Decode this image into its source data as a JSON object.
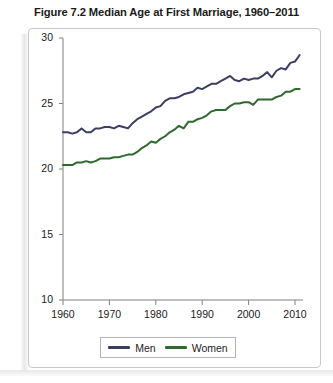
{
  "figure": {
    "title": "Figure 7.2  Median Age at First Marriage, 1960–2011"
  },
  "legend": {
    "entries": [
      {
        "label": "Men",
        "color": "#3a3f63"
      },
      {
        "label": "Women",
        "color": "#2d6b2d"
      }
    ]
  },
  "axes": {
    "y_ticks": [
      "30",
      "25",
      "20",
      "15",
      "10"
    ],
    "x_ticks": [
      "1960",
      "1970",
      "1980",
      "1990",
      "2000",
      "2010"
    ]
  },
  "colors": {
    "men": "#3a3f63",
    "women": "#2d6b2d",
    "axis": "#808080",
    "frame": "#c8c8c8",
    "text": "#1a1a1a",
    "plot_background": "#ffffff"
  },
  "chart_data": {
    "type": "line",
    "title": "Figure 7.2  Median Age at First Marriage, 1960–2011",
    "xlabel": "",
    "ylabel": "",
    "xlim": [
      1960,
      2011
    ],
    "ylim": [
      10,
      30
    ],
    "y_ticks": [
      10,
      15,
      20,
      25,
      30
    ],
    "x_ticks": [
      1960,
      1970,
      1980,
      1990,
      2000,
      2010
    ],
    "grid": false,
    "legend_position": "bottom-center",
    "x": [
      1960,
      1961,
      1962,
      1963,
      1964,
      1965,
      1966,
      1967,
      1968,
      1969,
      1970,
      1971,
      1972,
      1973,
      1974,
      1975,
      1976,
      1977,
      1978,
      1979,
      1980,
      1981,
      1982,
      1983,
      1984,
      1985,
      1986,
      1987,
      1988,
      1989,
      1990,
      1991,
      1992,
      1993,
      1994,
      1995,
      1996,
      1997,
      1998,
      1999,
      2000,
      2001,
      2002,
      2003,
      2004,
      2005,
      2006,
      2007,
      2008,
      2009,
      2010,
      2011
    ],
    "series": [
      {
        "name": "Men",
        "color": "#3a3f63",
        "values": [
          22.8,
          22.8,
          22.7,
          22.8,
          23.1,
          22.8,
          22.8,
          23.1,
          23.1,
          23.2,
          23.2,
          23.1,
          23.3,
          23.2,
          23.1,
          23.5,
          23.8,
          24.0,
          24.2,
          24.4,
          24.7,
          24.8,
          25.2,
          25.4,
          25.4,
          25.5,
          25.7,
          25.8,
          25.9,
          26.2,
          26.1,
          26.3,
          26.5,
          26.5,
          26.7,
          26.9,
          27.1,
          26.8,
          26.7,
          26.9,
          26.8,
          26.9,
          26.9,
          27.1,
          27.4,
          27.0,
          27.5,
          27.7,
          27.6,
          28.1,
          28.2,
          28.7
        ]
      },
      {
        "name": "Women",
        "color": "#2d6b2d",
        "values": [
          20.3,
          20.3,
          20.3,
          20.5,
          20.5,
          20.6,
          20.5,
          20.6,
          20.8,
          20.8,
          20.8,
          20.9,
          20.9,
          21.0,
          21.1,
          21.1,
          21.3,
          21.6,
          21.8,
          22.1,
          22.0,
          22.3,
          22.5,
          22.8,
          23.0,
          23.3,
          23.1,
          23.6,
          23.6,
          23.8,
          23.9,
          24.1,
          24.4,
          24.5,
          24.5,
          24.5,
          24.8,
          25.0,
          25.0,
          25.1,
          25.1,
          24.9,
          25.3,
          25.3,
          25.3,
          25.3,
          25.5,
          25.6,
          25.9,
          25.9,
          26.1,
          26.1
        ]
      }
    ]
  }
}
